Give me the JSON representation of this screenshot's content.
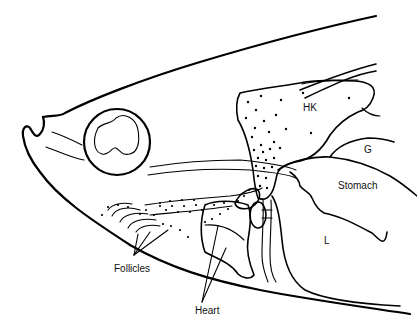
{
  "figure": {
    "type": "anatomical line drawing",
    "labels": {
      "hk": "HK",
      "g": "G",
      "stomach": "Stomach",
      "l": "L",
      "follicles": "Follicles",
      "heart": "Heart"
    },
    "colors": {
      "line": "#000000",
      "background": "#ffffff",
      "text": "#111111"
    }
  }
}
